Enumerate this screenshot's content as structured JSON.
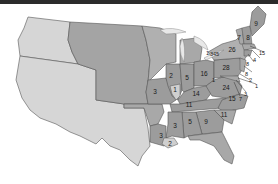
{
  "colors": {
    "territory_light": "#d6d6d6",
    "territory_mid": "#a8a8a8",
    "state": "#9c9c9c",
    "state_light": "#b8b8b8",
    "border": "#555555",
    "water": "#e8e8e8",
    "topbar": "#2b2b2b"
  },
  "states": [
    {
      "name": "Maine",
      "value": "9"
    },
    {
      "name": "New Hampshire",
      "value": "7"
    },
    {
      "name": "Vermont",
      "value": "8"
    },
    {
      "name": "Massachusetts",
      "value": "15"
    },
    {
      "name": "Rhode Island",
      "value": "4"
    },
    {
      "name": "Connecticut",
      "value": "8"
    },
    {
      "name": "New York",
      "value": "26"
    },
    {
      "name": "New Jersey",
      "value": "8"
    },
    {
      "name": "Pennsylvania",
      "value": "28"
    },
    {
      "name": "Delaware",
      "value": "2"
    },
    {
      "name": "Maryland",
      "value": "1"
    },
    {
      "name": "DC area 3",
      "value": "3"
    },
    {
      "name": "Virginia coast",
      "value": "7"
    },
    {
      "name": "Virginia",
      "value": "24"
    },
    {
      "name": "West pointer",
      "value": "1"
    },
    {
      "name": "Ohio",
      "value": "16"
    },
    {
      "name": "Indiana",
      "value": "5"
    },
    {
      "name": "Illinois",
      "value": "2"
    },
    {
      "name": "Illinois south",
      "value": "1"
    },
    {
      "name": "Missouri",
      "value": "3"
    },
    {
      "name": "Kentucky",
      "value": "14"
    },
    {
      "name": "Tennessee",
      "value": "11"
    },
    {
      "name": "North Carolina",
      "value": "15"
    },
    {
      "name": "South Carolina",
      "value": "11"
    },
    {
      "name": "Georgia",
      "value": "9"
    },
    {
      "name": "Alabama",
      "value": "5"
    },
    {
      "name": "Mississippi",
      "value": "3"
    },
    {
      "name": "Louisiana",
      "value": "3"
    },
    {
      "name": "Louisiana south",
      "value": "2"
    },
    {
      "name": "Michigan Lake Erie",
      "value": "1"
    },
    {
      "name": "Lake Erie cluster",
      "value": "345"
    }
  ]
}
